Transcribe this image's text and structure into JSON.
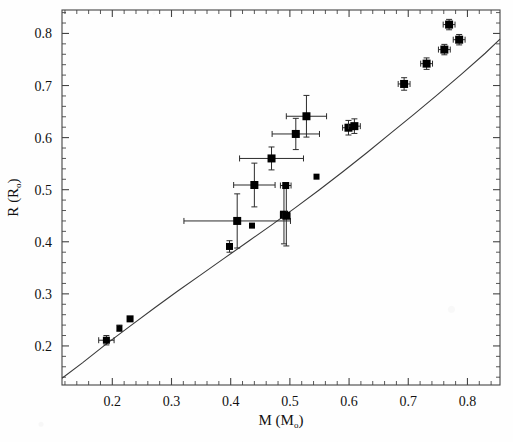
{
  "chart_data": {
    "type": "scatter",
    "title": "",
    "xlabel": "M (M☉)",
    "xlabel_main": "M (M",
    "xlabel_sub": "o",
    "xlabel_close": ")",
    "ylabel": "R (R☉)",
    "ylabel_main": "R (R",
    "ylabel_sub": "o",
    "ylabel_close": ")",
    "xlim": [
      0.115,
      0.855
    ],
    "ylim": [
      0.125,
      0.845
    ],
    "xticks": [
      0.2,
      0.3,
      0.4,
      0.5,
      0.6,
      0.7,
      0.8
    ],
    "xtick_labels": [
      "0.2",
      "0.3",
      "0.4",
      "0.5",
      "0.6",
      "0.7",
      "0.8"
    ],
    "yticks": [
      0.2,
      0.3,
      0.4,
      0.5,
      0.6,
      0.7,
      0.8
    ],
    "ytick_labels": [
      "0.2",
      "0.3",
      "0.4",
      "0.5",
      "0.6",
      "0.7",
      "0.8"
    ],
    "minor_tick_count": 5,
    "grid": false,
    "legend": null,
    "marker": "filled-square",
    "marker_color": "#000000",
    "line_color": "#3a3a3a",
    "frame_color": "#444444",
    "series": [
      {
        "name": "Observed eclipsing binaries",
        "type": "scatter",
        "points": [
          {
            "x": 0.19,
            "y": 0.211,
            "xerr": 0.013,
            "yerr": 0.009,
            "size": 7
          },
          {
            "x": 0.212,
            "y": 0.234,
            "xerr": 0.0,
            "yerr": 0.006,
            "size": 6
          },
          {
            "x": 0.23,
            "y": 0.252,
            "xerr": 0.0,
            "yerr": 0.0,
            "size": 7
          },
          {
            "x": 0.398,
            "y": 0.391,
            "xerr": 0.0,
            "yerr": 0.011,
            "size": 7
          },
          {
            "x": 0.411,
            "y": 0.44,
            "xerr": 0.09,
            "yerr": 0.052,
            "size": 8
          },
          {
            "x": 0.436,
            "y": 0.431,
            "xerr": 0.0,
            "yerr": 0.0,
            "size": 6
          },
          {
            "x": 0.44,
            "y": 0.509,
            "xerr": 0.035,
            "yerr": 0.042,
            "size": 8
          },
          {
            "x": 0.469,
            "y": 0.56,
            "xerr": 0.054,
            "yerr": 0.022,
            "size": 8
          },
          {
            "x": 0.49,
            "y": 0.452,
            "xerr": 0.006,
            "yerr": 0.056,
            "size": 8
          },
          {
            "x": 0.494,
            "y": 0.45,
            "xerr": 0.006,
            "yerr": 0.058,
            "size": 8
          },
          {
            "x": 0.493,
            "y": 0.508,
            "xerr": 0.009,
            "yerr": 0.0,
            "size": 7
          },
          {
            "x": 0.51,
            "y": 0.607,
            "xerr": 0.04,
            "yerr": 0.03,
            "size": 8
          },
          {
            "x": 0.528,
            "y": 0.641,
            "xerr": 0.034,
            "yerr": 0.04,
            "size": 8
          },
          {
            "x": 0.545,
            "y": 0.525,
            "xerr": 0.0,
            "yerr": 0.0,
            "size": 6
          },
          {
            "x": 0.599,
            "y": 0.619,
            "xerr": 0.01,
            "yerr": 0.014,
            "size": 8
          },
          {
            "x": 0.609,
            "y": 0.622,
            "xerr": 0.01,
            "yerr": 0.014,
            "size": 8
          },
          {
            "x": 0.693,
            "y": 0.703,
            "xerr": 0.01,
            "yerr": 0.012,
            "size": 8
          },
          {
            "x": 0.731,
            "y": 0.742,
            "xerr": 0.01,
            "yerr": 0.011,
            "size": 8
          },
          {
            "x": 0.761,
            "y": 0.769,
            "xerr": 0.01,
            "yerr": 0.01,
            "size": 8
          },
          {
            "x": 0.769,
            "y": 0.817,
            "xerr": 0.01,
            "yerr": 0.01,
            "size": 8
          },
          {
            "x": 0.786,
            "y": 0.788,
            "xerr": 0.01,
            "yerr": 0.01,
            "size": 8
          }
        ]
      },
      {
        "name": "Theoretical model",
        "type": "line",
        "x": [
          0.115,
          0.15,
          0.19,
          0.23,
          0.27,
          0.31,
          0.35,
          0.39,
          0.43,
          0.47,
          0.51,
          0.55,
          0.59,
          0.63,
          0.67,
          0.71,
          0.75,
          0.79,
          0.83,
          0.855
        ],
        "y": [
          0.138,
          0.168,
          0.204,
          0.238,
          0.272,
          0.305,
          0.337,
          0.369,
          0.401,
          0.433,
          0.466,
          0.5,
          0.535,
          0.571,
          0.608,
          0.645,
          0.683,
          0.722,
          0.762,
          0.789
        ]
      }
    ]
  },
  "figure": {
    "caption": "",
    "background": "#fefefe"
  }
}
